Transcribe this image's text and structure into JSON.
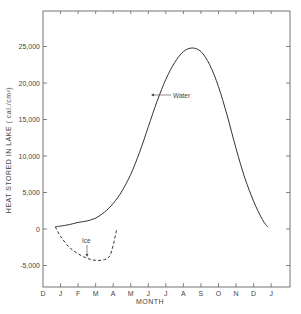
{
  "chart_data": {
    "type": "line",
    "title": "",
    "xlabel": "MONTH",
    "ylabel": "HEAT STORED IN LAKE ( cal./cm²)",
    "x_tick_labels": [
      "D",
      "J",
      "F",
      "M",
      "A",
      "M",
      "J",
      "J",
      "A",
      "S",
      "O",
      "N",
      "D",
      "J"
    ],
    "y_tick_labels": [
      "25,000",
      "20,000",
      "15,000",
      "10,000",
      "5,000",
      "0",
      "-5,000"
    ],
    "y_ticks": [
      25000,
      20000,
      15000,
      10000,
      5000,
      0,
      -5000
    ],
    "ylim": [
      -7500,
      29000
    ],
    "xlim_months": [
      0,
      14
    ],
    "grid": false,
    "legend": "none (inline annotations)",
    "annotations": [
      {
        "text": "Water",
        "target_series": "Water"
      },
      {
        "text": "Ice",
        "target_series": "Ice"
      }
    ],
    "series": [
      {
        "name": "Water",
        "style": "solid",
        "x_months": [
          0.7,
          1.0,
          1.5,
          2.0,
          2.5,
          3.0,
          3.5,
          4.0,
          4.5,
          5.0,
          5.5,
          6.0,
          6.5,
          7.0,
          7.5,
          8.0,
          8.5,
          9.0,
          9.5,
          10.0,
          10.5,
          11.0,
          11.5,
          12.0,
          12.5,
          12.8
        ],
        "y": [
          300,
          400,
          600,
          900,
          1100,
          1500,
          2300,
          3500,
          5200,
          7500,
          10500,
          14000,
          17500,
          20500,
          22800,
          24300,
          24800,
          24300,
          22500,
          19500,
          15500,
          11000,
          7000,
          3800,
          1300,
          300
        ]
      },
      {
        "name": "Ice",
        "style": "dashed",
        "x_months": [
          0.7,
          1.0,
          1.5,
          2.0,
          2.5,
          3.0,
          3.5,
          3.8,
          4.0,
          4.2
        ],
        "y": [
          300,
          -1000,
          -2500,
          -3400,
          -4000,
          -4300,
          -4200,
          -3700,
          -2200,
          0
        ]
      }
    ]
  },
  "labels": {
    "water": "Water",
    "ice": "Ice",
    "xlabel": "MONTH",
    "ylabel": "HEAT STORED IN LAKE  ( cal./cm²)"
  }
}
